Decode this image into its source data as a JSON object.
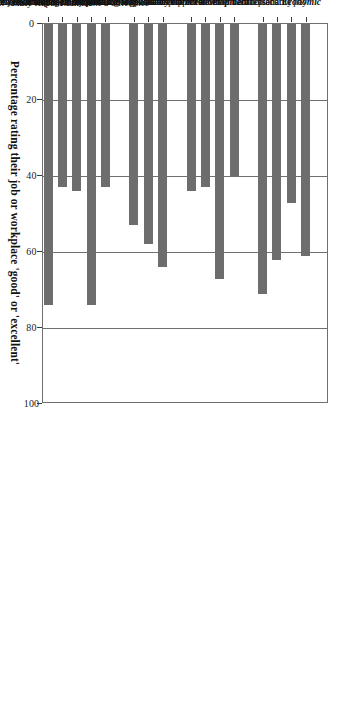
{
  "chart_data": {
    "type": "bar",
    "orientation": "horizontal",
    "title": "",
    "xlabel": "Percentage rating their job or workplace 'good' or 'excellent'",
    "ylabel": "",
    "xlim": [
      0,
      100
    ],
    "xticks": [
      0,
      20,
      40,
      60,
      80,
      100
    ],
    "grid": true,
    "grid_axis": "x",
    "legend": false,
    "bar_color": "#6d6d6d",
    "categories": [
      "Economic",
      "Fair/reasonable pay",
      "Job security",
      "Health or dental plans",
      "Paid vacation",
      "Career development",
      "Opportunity for advancement",
      "Bias-free promotions",
      "Funding for skills development",
      "Time off for skills development",
      "Contribution and involvement",
      "Can do my work the way I want",
      "Place where I can make a difference",
      "Participate in decision-making",
      "Human-resource management practices",
      "Effective performance evaluations or feedback",
      "Flexibility to respond to personal or family responsibilities",
      "Communicates changes effectively to staff",
      "Recognizes employee excellence",
      "Overall fair treatment"
    ],
    "category_is_header": [
      true,
      false,
      false,
      false,
      false,
      true,
      false,
      false,
      false,
      false,
      true,
      false,
      false,
      false,
      true,
      false,
      false,
      false,
      false,
      false
    ],
    "values": [
      null,
      61,
      47,
      62,
      71,
      null,
      40,
      67,
      43,
      44,
      null,
      64,
      58,
      53,
      null,
      43,
      74,
      44,
      43,
      74
    ]
  },
  "axis": {
    "tick_labels": [
      "0",
      "20",
      "40",
      "60",
      "80",
      "100"
    ],
    "title": "Percentage rating their job or workplace 'good' or 'excellent'"
  }
}
